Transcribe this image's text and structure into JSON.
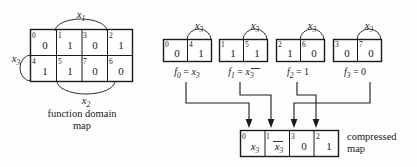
{
  "figure": {
    "domain_map": {
      "caption_line1": "function domain",
      "caption_line2": "map",
      "row_top": {
        "indices": [
          "0",
          "1",
          "3",
          "2"
        ],
        "values": [
          "0",
          "1",
          "0",
          "1"
        ]
      },
      "row_bottom": {
        "indices": [
          "4",
          "5",
          "7",
          "6"
        ],
        "values": [
          "1",
          "1",
          "0",
          "0"
        ]
      },
      "labels": {
        "x1_var": "x",
        "x1_sub": "1",
        "x2_var": "x",
        "x2_sub": "2",
        "x3_var": "x",
        "x3_sub": "3"
      }
    },
    "columns": [
      {
        "id": "col0",
        "arc_label_var": "x",
        "arc_label_sub": "3",
        "cells": [
          {
            "index": "0",
            "value": "0"
          },
          {
            "index": "4",
            "value": "1"
          }
        ],
        "fn_name": "f",
        "fn_sub": "0",
        "fn_eq": "=",
        "fn_expr": "x",
        "fn_expr_sub": "3",
        "fn_overline": false,
        "fn_text": "f0 = x3"
      },
      {
        "id": "col1",
        "arc_label_var": "x",
        "arc_label_sub": "3",
        "cells": [
          {
            "index": "1",
            "value": "1"
          },
          {
            "index": "5",
            "value": "1"
          }
        ],
        "fn_name": "f",
        "fn_sub": "1",
        "fn_eq": "=",
        "fn_expr": "x",
        "fn_expr_sub": "3",
        "fn_overline": true,
        "fn_text": "f1 = x3-bar"
      },
      {
        "id": "col2",
        "arc_label_var": "x",
        "arc_label_sub": "3",
        "cells": [
          {
            "index": "2",
            "value": "1"
          },
          {
            "index": "6",
            "value": "0"
          }
        ],
        "fn_name": "f",
        "fn_sub": "2",
        "fn_eq": "=",
        "fn_expr": "1",
        "fn_expr_sub": "",
        "fn_overline": false,
        "fn_text": "f2 = 1"
      },
      {
        "id": "col3",
        "arc_label_var": "x",
        "arc_label_sub": "3",
        "cells": [
          {
            "index": "3",
            "value": "0"
          },
          {
            "index": "7",
            "value": "0"
          }
        ],
        "fn_name": "f",
        "fn_sub": "3",
        "fn_eq": "=",
        "fn_expr": "0",
        "fn_expr_sub": "",
        "fn_overline": false,
        "fn_text": "f3 = 0"
      }
    ],
    "compressed_map": {
      "caption_line1": "compressed",
      "caption_line2": "map",
      "cells": [
        {
          "index": "0",
          "value": "x",
          "value_sub": "3",
          "overline": false
        },
        {
          "index": "1",
          "value": "x",
          "value_sub": "3",
          "overline": true
        },
        {
          "index": "3",
          "value": "0",
          "value_sub": "",
          "overline": false
        },
        {
          "index": "2",
          "value": "1",
          "value_sub": "",
          "overline": false
        }
      ]
    },
    "colors": {
      "ink": "#1a1a1a",
      "background": "#fefefe"
    }
  }
}
